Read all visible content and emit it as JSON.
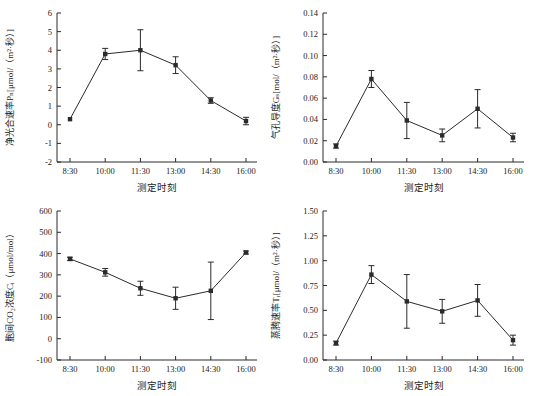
{
  "figure": {
    "background": "#ffffff",
    "line_color": "#2b2b2b",
    "text_color": "#222222",
    "shared_xlabel": "测定时刻",
    "shared_categories": [
      "8:30",
      "10:00",
      "11:30",
      "13:00",
      "14:30",
      "16:00"
    ]
  },
  "chart_data": [
    {
      "type": "line",
      "id": "net-photosynthetic-rate",
      "ylabel": "净光合速率Pₙ[μmol/（m²·秒）]",
      "xlabel": "测定时刻",
      "categories": [
        "8:30",
        "10:00",
        "11:30",
        "13:00",
        "14:30",
        "16:00"
      ],
      "values": [
        0.3,
        3.8,
        4.0,
        3.2,
        1.3,
        0.2
      ],
      "errors": [
        0,
        0.3,
        1.1,
        0.45,
        0.15,
        0.2
      ],
      "ylim": [
        -2,
        6
      ],
      "ytick_step": 1,
      "ytick_decimals": 0,
      "marker": "square",
      "legend": "none",
      "grid": "off"
    },
    {
      "type": "line",
      "id": "stomatal-conductance",
      "ylabel": "气孔导度Gₛ[mol/（m²·秒）]",
      "xlabel": "测定时刻",
      "categories": [
        "8:30",
        "10:00",
        "11:30",
        "13:00",
        "14:30",
        "16:00"
      ],
      "values": [
        0.015,
        0.078,
        0.039,
        0.025,
        0.05,
        0.023
      ],
      "errors": [
        0.002,
        0.008,
        0.017,
        0.006,
        0.018,
        0.004
      ],
      "ylim": [
        0,
        0.14
      ],
      "ytick_step": 0.02,
      "ytick_decimals": 2,
      "marker": "square",
      "legend": "none",
      "grid": "off"
    },
    {
      "type": "line",
      "id": "intercellular-co2-concentration",
      "ylabel": "胞间CO₂浓度Cᵢ（μmol/mol）",
      "xlabel": "测定时刻",
      "categories": [
        "8:30",
        "10:00",
        "11:30",
        "13:00",
        "14:30",
        "16:00"
      ],
      "values": [
        375,
        312,
        237,
        190,
        225,
        405
      ],
      "errors": [
        8,
        18,
        33,
        52,
        135,
        7
      ],
      "ylim": [
        -100,
        600
      ],
      "ytick_step": 100,
      "ytick_decimals": 0,
      "marker": "square",
      "legend": "none",
      "grid": "off"
    },
    {
      "type": "line",
      "id": "transpiration-rate",
      "ylabel": "蒸腾速率Tᵣ[μmol/（m²·秒）]",
      "xlabel": "测定时刻",
      "categories": [
        "8:30",
        "10:00",
        "11:30",
        "13:00",
        "14:30",
        "16:00"
      ],
      "values": [
        0.17,
        0.86,
        0.59,
        0.49,
        0.6,
        0.2
      ],
      "errors": [
        0.02,
        0.09,
        0.27,
        0.12,
        0.16,
        0.05
      ],
      "ylim": [
        0,
        1.5
      ],
      "ytick_step": 0.25,
      "ytick_decimals": 2,
      "marker": "square",
      "legend": "none",
      "grid": "off"
    }
  ]
}
